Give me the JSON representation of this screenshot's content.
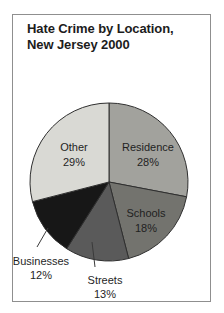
{
  "title": {
    "line1": "Hate Crime by Location,",
    "line2": "New Jersey 2000"
  },
  "chart_data": {
    "type": "pie",
    "title": "Hate Crime by Location, New Jersey 2000",
    "categories": [
      "Residence",
      "Schools",
      "Streets",
      "Businesses",
      "Other"
    ],
    "values": [
      28,
      18,
      13,
      12,
      29
    ],
    "value_labels": [
      "28%",
      "18%",
      "13%",
      "12%",
      "29%"
    ],
    "unit": "percent",
    "start_angle_deg": 0,
    "direction": "clockwise",
    "slice_colors": [
      "#a2a29d",
      "#73736e",
      "#5a5a5a",
      "#171717",
      "#d9d9d4"
    ],
    "outline_color": "#2f2f2f",
    "leader_line_color": "#3a3a3a",
    "label_placement": [
      "inside",
      "inside",
      "outside-below",
      "outside-left",
      "inside"
    ],
    "legend": "none"
  },
  "colors": {
    "background": "#ffffff",
    "panel_border": "#8f8f8f",
    "text": "#1c1c1c"
  }
}
